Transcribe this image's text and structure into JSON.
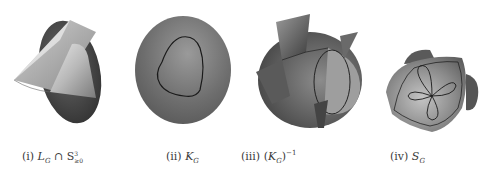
{
  "figure": {
    "panels": [
      {
        "id": "i",
        "label": "(i)",
        "symbol": "L",
        "subscript": "G",
        "operator": "∩",
        "set": "S",
        "set_superscript": "3",
        "set_subscript": "≥0",
        "description": "cone-like surface intersected with sphere"
      },
      {
        "id": "ii",
        "label": "(ii)",
        "symbol": "K",
        "subscript": "G",
        "description": "disk with closed rounded-triangle curve"
      },
      {
        "id": "iii",
        "label": "(iii)",
        "open_paren": "(",
        "symbol": "K",
        "subscript": "G",
        "close_paren": ")",
        "superscript": "−1",
        "description": "sphere with fin-like sheets and ellipse curve"
      },
      {
        "id": "iv",
        "label": "(iv)",
        "symbol": "S",
        "subscript": "G",
        "description": "rounded tetrahedral surface with four-petal curve"
      }
    ]
  }
}
